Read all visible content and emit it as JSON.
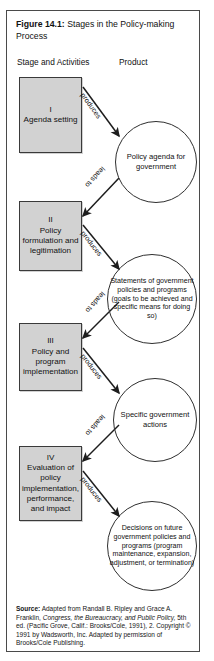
{
  "figure": {
    "caption_label": "Figure 14.1:",
    "caption_text": "Stages in the Policy-making Process",
    "headers": {
      "stage": "Stage and Activities",
      "product": "Product"
    }
  },
  "stages": [
    {
      "roman": "I",
      "text": "Agenda setting"
    },
    {
      "roman": "II",
      "text": "Policy formulation and legitimation"
    },
    {
      "roman": "III",
      "text": "Policy and program implementation"
    },
    {
      "roman": "IV",
      "text": "Evaluation of policy implementation, performance, and impact"
    }
  ],
  "products": [
    {
      "text": "Policy agenda for government"
    },
    {
      "text": "Statements of government policies and programs (goals to be achieved and specific means for doing so)"
    },
    {
      "text": "Specific government actions"
    },
    {
      "text": "Decisions on future government policies and programs (program maintenance, expansion, adjustment, or termination)"
    }
  ],
  "arrow_labels": {
    "produces": "produces",
    "leads_to": "leads to"
  },
  "source": {
    "label": "Source:",
    "part1": " Adapted from Randall B. Ripley and Grace A. Franklin, ",
    "italic": "Congress, the Bureaucracy, and Public Policy,",
    "part2": " 5th ed. (Pacific Grove, Calif.: Brooks/Cole, 1991), 2. Copyright © 1991 by Wadsworth, Inc. Adapted by permission of Brooks/Cole Publishing."
  },
  "colors": {
    "box_fill": "#d2d2d2",
    "box_stroke": "#3a3a3a",
    "frame_stroke": "#4a4a4a",
    "circle_stroke": "#2f2f2f",
    "text": "#111111"
  }
}
